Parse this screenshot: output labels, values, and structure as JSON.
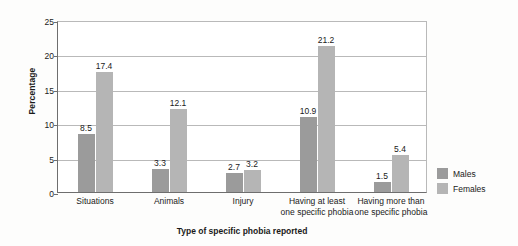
{
  "chart_data": {
    "type": "bar",
    "title": "",
    "xlabel": "Type of specific phobia reported",
    "ylabel": "Percentage",
    "ylim": [
      0,
      25
    ],
    "yticks": [
      0,
      5,
      10,
      15,
      20,
      25
    ],
    "grid": true,
    "legend_position": "right",
    "categories": [
      "Situations",
      "Animals",
      "Injury",
      "Having at least one specific phobia",
      "Having more than one specific phobia"
    ],
    "category_lines": [
      [
        "Situations"
      ],
      [
        "Animals"
      ],
      [
        "Injury"
      ],
      [
        "Having at least",
        "one specific phobia"
      ],
      [
        "Having more than",
        "one specific phobia"
      ]
    ],
    "series": [
      {
        "name": "Males",
        "color": "#9b9b9b",
        "values": [
          8.5,
          3.3,
          2.7,
          10.9,
          1.5
        ],
        "labels": [
          "8.5",
          "3.3",
          "2.7",
          "10.9",
          "1.5"
        ]
      },
      {
        "name": "Females",
        "color": "#b5b5b5",
        "values": [
          17.4,
          12.1,
          3.2,
          21.2,
          5.4
        ],
        "labels": [
          "17.4",
          "12.1",
          "3.2",
          "21.2",
          "5.4"
        ]
      }
    ]
  },
  "legend": {
    "items": [
      {
        "label": "Males",
        "color": "#9b9b9b"
      },
      {
        "label": "Females",
        "color": "#b5b5b5"
      }
    ]
  }
}
